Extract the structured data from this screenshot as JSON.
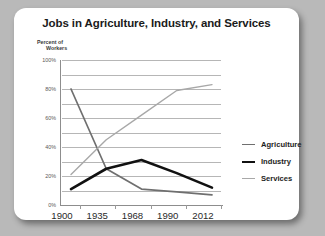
{
  "card": {
    "title": "Jobs in Agriculture, Industry, and Services"
  },
  "axis": {
    "ylabel_line1": "Percent of",
    "ylabel_line2": "Workers"
  },
  "legend": {
    "items": [
      {
        "label": "Agriculture",
        "color": "#6f6f6f",
        "width": 1.6
      },
      {
        "label": "Industry",
        "color": "#111111",
        "width": 2.6
      },
      {
        "label": "Services",
        "color": "#a8a8a8",
        "width": 1.4
      }
    ]
  },
  "chart_data": {
    "type": "line",
    "title": "Jobs in Agriculture, Industry, and Services",
    "xlabel": "",
    "ylabel": "Percent of Workers",
    "categories": [
      "1900",
      "1935",
      "1968",
      "1990",
      "2012"
    ],
    "x": [
      1900,
      1935,
      1968,
      1990,
      2012
    ],
    "ylim": [
      0,
      100
    ],
    "xtick_labels": [
      "1900",
      "1935",
      "1968",
      "1990",
      "2012"
    ],
    "ytick_labels": [
      "0%",
      "20%",
      "40%",
      "60%",
      "80%",
      "100%"
    ],
    "ytick_values": [
      0,
      20,
      40,
      60,
      80,
      100
    ],
    "gridlines": [
      10,
      20,
      30,
      40,
      50,
      60,
      70,
      80,
      90,
      100
    ],
    "grid": true,
    "legend_position": "right",
    "series": [
      {
        "name": "Agriculture",
        "color": "#6f6f6f",
        "values": [
          80,
          25,
          11,
          9,
          7
        ]
      },
      {
        "name": "Industry",
        "color": "#111111",
        "values": [
          11,
          25,
          31,
          22,
          12
        ]
      },
      {
        "name": "Services",
        "color": "#a8a8a8",
        "values": [
          21,
          45,
          62,
          79,
          83
        ]
      }
    ]
  }
}
